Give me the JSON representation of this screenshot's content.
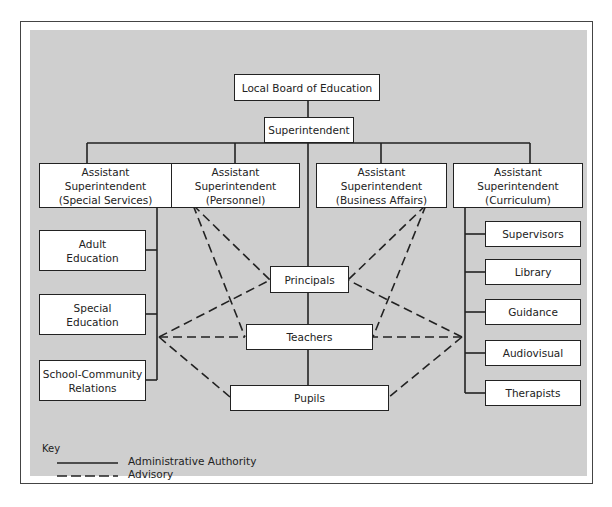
{
  "diagram": {
    "type": "organizational-chart",
    "nodes": {
      "board": "Local Board of Education",
      "superintendent": "Superintendent",
      "asst_special": {
        "line1": "Assistant Superintendent",
        "line2": "(Special Services)"
      },
      "asst_personnel": {
        "line1": "Assistant Superintendent",
        "line2": "(Personnel)"
      },
      "asst_business": {
        "line1": "Assistant Superintendent",
        "line2": "(Business Affairs)"
      },
      "asst_curriculum": {
        "line1": "Assistant Superintendent",
        "line2": "(Curriculum)"
      },
      "special_services_units": [
        {
          "line1": "Adult",
          "line2": "Education"
        },
        {
          "line1": "Special",
          "line2": "Education"
        },
        {
          "line1": "School-Community",
          "line2": "Relations"
        }
      ],
      "curriculum_units": [
        "Supervisors",
        "Library",
        "Guidance",
        "Audiovisual",
        "Therapists"
      ],
      "principals": "Principals",
      "teachers": "Teachers",
      "pupils": "Pupils"
    },
    "edges": {
      "administrative_authority": [
        [
          "Local Board of Education",
          "Superintendent"
        ],
        [
          "Superintendent",
          "Assistant Superintendent (Special Services)"
        ],
        [
          "Superintendent",
          "Assistant Superintendent (Personnel)"
        ],
        [
          "Superintendent",
          "Assistant Superintendent (Business Affairs)"
        ],
        [
          "Superintendent",
          "Assistant Superintendent (Curriculum)"
        ],
        [
          "Superintendent",
          "Principals"
        ],
        [
          "Principals",
          "Teachers"
        ],
        [
          "Teachers",
          "Pupils"
        ],
        [
          "Assistant Superintendent (Special Services)",
          "Adult Education"
        ],
        [
          "Assistant Superintendent (Special Services)",
          "Special Education"
        ],
        [
          "Assistant Superintendent (Special Services)",
          "School-Community Relations"
        ],
        [
          "Assistant Superintendent (Curriculum)",
          "Supervisors"
        ],
        [
          "Assistant Superintendent (Curriculum)",
          "Library"
        ],
        [
          "Assistant Superintendent (Curriculum)",
          "Guidance"
        ],
        [
          "Assistant Superintendent (Curriculum)",
          "Audiovisual"
        ],
        [
          "Assistant Superintendent (Curriculum)",
          "Therapists"
        ]
      ],
      "advisory": [
        [
          "Assistant Superintendent (Personnel)",
          "Principals"
        ],
        [
          "Assistant Superintendent (Personnel)",
          "Teachers"
        ],
        [
          "Assistant Superintendent (Business Affairs)",
          "Principals"
        ],
        [
          "Assistant Superintendent (Business Affairs)",
          "Teachers"
        ],
        [
          "Special Services",
          "Principals"
        ],
        [
          "Special Services",
          "Teachers"
        ],
        [
          "Special Services",
          "Pupils"
        ],
        [
          "Curriculum",
          "Principals"
        ],
        [
          "Curriculum",
          "Teachers"
        ],
        [
          "Curriculum",
          "Pupils"
        ]
      ]
    },
    "key": {
      "title": "Key",
      "solid": "Administrative Authority",
      "dashed": "Advisory"
    },
    "colors": {
      "panel": "#cfcfcf",
      "box": "#ffffff",
      "line": "#222222"
    }
  }
}
